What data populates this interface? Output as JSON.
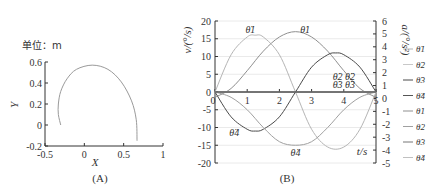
{
  "chart_data": [
    {
      "type": "line",
      "panel": "A",
      "caption": "(A)",
      "unit_label": "单位：m",
      "xlabel": "X",
      "ylabel": "Y",
      "xlim": [
        -0.5,
        1
      ],
      "ylim": [
        -0.2,
        0.6
      ],
      "xticks": [
        "-0.5",
        "0",
        "0.5",
        "1"
      ],
      "yticks": [
        "-0.2",
        "0",
        "0.2",
        "0.4",
        "0.6"
      ],
      "series": [
        {
          "name": "trajectory",
          "color": "#9a9a9a",
          "points": [
            [
              -0.3,
              0.0
            ],
            [
              -0.33,
              0.1
            ],
            [
              -0.33,
              0.2
            ],
            [
              -0.3,
              0.32
            ],
            [
              -0.22,
              0.44
            ],
            [
              -0.1,
              0.53
            ],
            [
              0.1,
              0.57
            ],
            [
              0.3,
              0.53
            ],
            [
              0.47,
              0.41
            ],
            [
              0.6,
              0.23
            ],
            [
              0.66,
              0.05
            ],
            [
              0.67,
              -0.15
            ]
          ]
        }
      ]
    },
    {
      "type": "line",
      "panel": "B",
      "caption": "(B)",
      "xlabel": "t/s",
      "ylabel_left": "v/(°/s)",
      "ylabel_right": "a/(°/s²)",
      "xlim": [
        0,
        5
      ],
      "ylim_left": [
        -20,
        20
      ],
      "ylim_right": [
        -5,
        6
      ],
      "xticks": [
        "0",
        "1",
        "2",
        "3",
        "4",
        "5"
      ],
      "yticks_left": [
        "-20",
        "-15",
        "-10",
        "-5",
        "0",
        "5",
        "10",
        "15",
        "20"
      ],
      "yticks_right": [
        "-5",
        "-4",
        "-3",
        "-2",
        "-1",
        "0",
        "1",
        "2",
        "3",
        "4",
        "5",
        "6"
      ],
      "grid": true,
      "legend_position": "right",
      "legend": [
        "θ̈1",
        "θ̈2",
        "θ̈3",
        "θ̈4",
        "θ̇1",
        "θ̇2",
        "θ̇3",
        "θ̇4"
      ],
      "annotations": [
        {
          "text": "θ̈1",
          "at": [
            1.1,
            16.5
          ]
        },
        {
          "text": "θ̇1",
          "at": [
            2.8,
            16.5
          ]
        },
        {
          "text": "θ̇2 θ̈2",
          "at": [
            4.0,
            3.5
          ]
        },
        {
          "text": "θ̇3 θ̈3",
          "at": [
            4.0,
            1.0
          ]
        },
        {
          "text": "θ̈4",
          "at": [
            0.6,
            -12.5
          ]
        },
        {
          "text": "θ̇4",
          "at": [
            2.5,
            -18.0
          ]
        }
      ],
      "series": [
        {
          "name": "θ̈1",
          "axis": "left",
          "color": "#b5b5b5",
          "x": [
            0,
            0.5,
            1,
            1.25,
            1.5,
            2,
            2.5,
            3,
            3.5,
            4,
            4.5,
            5
          ],
          "values": [
            0,
            10.5,
            15.5,
            16,
            15.5,
            10.5,
            0,
            -10.5,
            -15.5,
            -15.5,
            -10.5,
            0
          ]
        },
        {
          "name": "θ̇1",
          "axis": "left",
          "color": "#8f8f8f",
          "x": [
            0,
            0.5,
            1,
            1.5,
            2,
            2.5,
            3,
            3.5,
            4,
            4.5,
            5
          ],
          "values": [
            -1.5,
            1,
            6,
            11.5,
            15.5,
            17,
            15.5,
            11.5,
            6,
            1,
            -1.5
          ]
        },
        {
          "name": "θ̈2",
          "axis": "left",
          "color": "#4a4a4a",
          "x": [
            0,
            0.5,
            1,
            1.25,
            1.5,
            2,
            2.5,
            3,
            3.5,
            3.75,
            4,
            4.5,
            5
          ],
          "values": [
            0,
            -7,
            -10.5,
            -11,
            -10.5,
            -7,
            0,
            7,
            10.5,
            11,
            10.5,
            7,
            0
          ]
        },
        {
          "name": "θ̇2",
          "axis": "left",
          "color": "#a0a0a0",
          "x": [
            0,
            0.5,
            1,
            1.5,
            2,
            2.5,
            3,
            3.5,
            4,
            4.5,
            5
          ],
          "values": [
            0,
            -1.5,
            -5,
            -10,
            -14,
            -15,
            -14,
            -10,
            -5,
            -1.5,
            0
          ]
        },
        {
          "name": "θ̈3",
          "axis": "left",
          "color": "#555555",
          "x": [
            0,
            5
          ],
          "values": [
            0,
            0
          ]
        },
        {
          "name": "θ̇3",
          "axis": "left",
          "color": "#777777",
          "x": [
            0,
            5
          ],
          "values": [
            0,
            0
          ]
        }
      ]
    }
  ]
}
